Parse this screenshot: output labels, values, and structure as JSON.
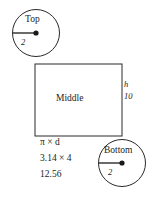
{
  "diagram": {
    "type": "cylinder-net",
    "shapes": {
      "top_circle": {
        "label": "Top",
        "radius_label": "2",
        "cx": 36,
        "cy": 33,
        "r": 23.5
      },
      "bottom_circle": {
        "label": "Bottom",
        "radius_label": "2",
        "cx": 122,
        "cy": 163,
        "r": 23.5
      },
      "rectangle": {
        "label": "Middle",
        "x": 35,
        "y": 64,
        "width": 87,
        "height": 72
      }
    },
    "annotations": {
      "height_symbol": "h",
      "height_value": "10",
      "circumference_formula": "π × d",
      "circumference_substitution": "3.14 × 4",
      "circumference_result": "12.56"
    },
    "colors": {
      "stroke": "#2b2b2b",
      "text": "#1c1c1c",
      "background": "#ffffff"
    }
  }
}
